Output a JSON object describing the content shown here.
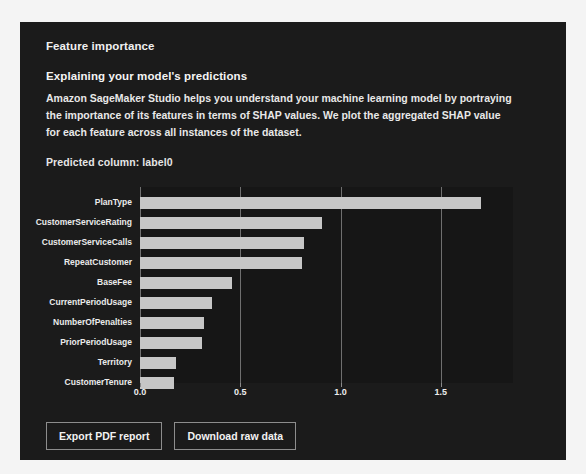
{
  "panel": {
    "section_title": "Feature importance",
    "subsection_title": "Explaining your model's predictions",
    "description": "Amazon SageMaker Studio helps you understand your machine learning model by portraying the importance of its features in terms of SHAP values. We plot the aggregated SHAP value for each feature across all instances of the dataset.",
    "predicted_column": "Predicted column: label0"
  },
  "colors": {
    "panel_background": "#1b1b1b",
    "page_background": "#f4f4f4",
    "bar_fill": "#c6c6c6",
    "gridline": "#6f6f6f",
    "text": "#ededed"
  },
  "buttons": {
    "export_pdf": "Export PDF report",
    "download_raw": "Download raw data"
  },
  "chart_data": {
    "type": "bar",
    "orientation": "horizontal",
    "title": "",
    "xlabel": "",
    "ylabel": "",
    "xlim": [
      0.0,
      1.86
    ],
    "xticks": [
      "0.0",
      "0.5",
      "1.0",
      "1.5"
    ],
    "xtick_values": [
      0.0,
      0.5,
      1.0,
      1.5
    ],
    "grid": true,
    "legend": false,
    "categories": [
      "PlanType",
      "CustomerServiceRating",
      "CustomerServiceCalls",
      "RepeatCustomer",
      "BaseFee",
      "CurrentPeriodUsage",
      "NumberOfPenalties",
      "PriorPeriodUsage",
      "Territory",
      "CustomerTenure"
    ],
    "values": [
      1.7,
      0.91,
      0.82,
      0.81,
      0.46,
      0.36,
      0.32,
      0.31,
      0.18,
      0.17
    ]
  }
}
